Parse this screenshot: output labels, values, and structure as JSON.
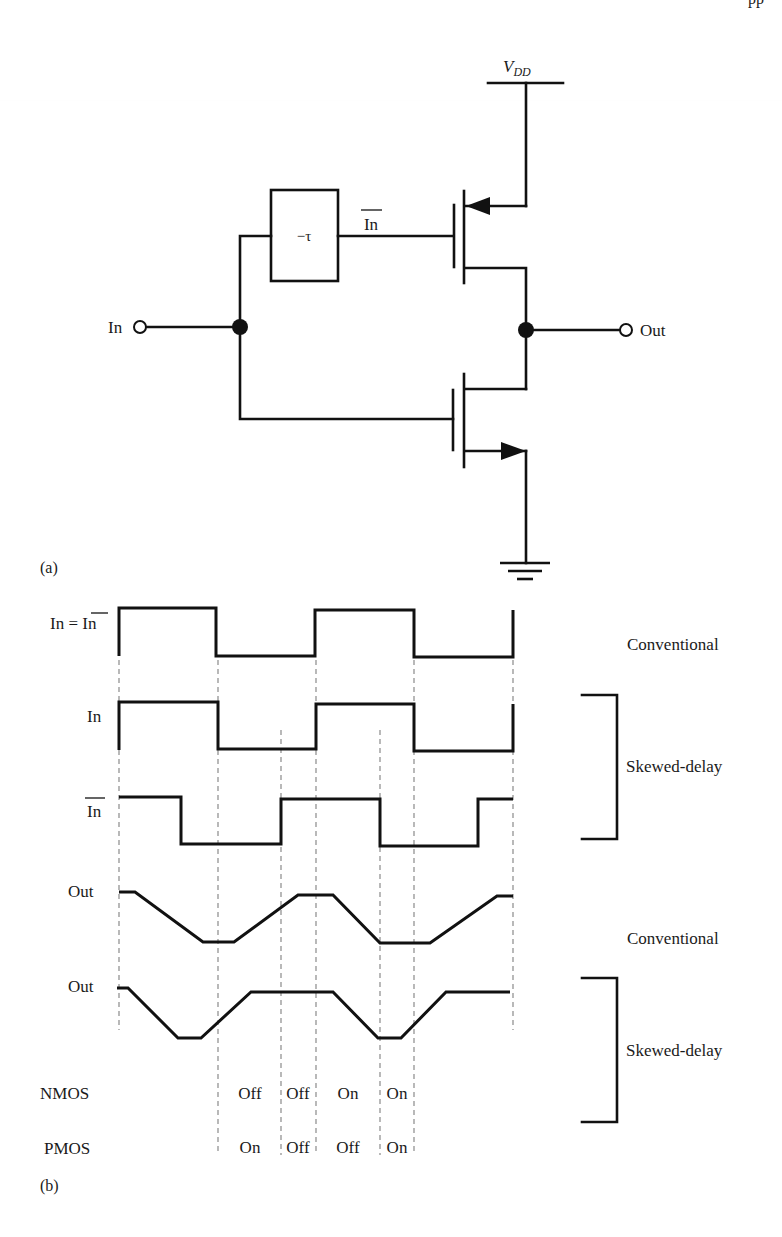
{
  "header_fragment": "pp",
  "circuit": {
    "part_label": "(a)",
    "vdd_label": "V",
    "vdd_subscript": "DD",
    "delay_block_label": "−τ",
    "gate_signal_label": "In",
    "input_label": "In",
    "output_label": "Out",
    "components": [
      "vdd-rail",
      "pmos-transistor",
      "nmos-transistor",
      "delay-block",
      "ground-symbol",
      "input-terminal",
      "output-terminal"
    ]
  },
  "timing": {
    "part_label": "(b)",
    "rows": [
      {
        "label": "In = ",
        "label_bar": "In",
        "group": "Conventional"
      },
      {
        "label": "In",
        "group": "Skewed-delay"
      },
      {
        "label_bar": "In",
        "group": "Skewed-delay"
      },
      {
        "label": "Out",
        "group": "Conventional"
      },
      {
        "label": "Out",
        "group": "Skewed-delay"
      }
    ],
    "group_labels": {
      "conventional_top": "Conventional",
      "skewed_top": "Skewed-delay",
      "conventional_bottom": "Conventional",
      "skewed_bottom": "Skewed-delay"
    },
    "state_rows": {
      "nmos_label": "NMOS",
      "pmos_label": "PMOS",
      "nmos_states": [
        "Off",
        "Off",
        "On",
        "On"
      ],
      "pmos_states": [
        "On",
        "Off",
        "Off",
        "On"
      ]
    }
  }
}
